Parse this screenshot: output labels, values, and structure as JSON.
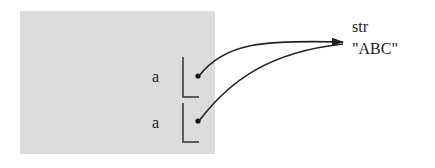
{
  "diagram": {
    "frame": {
      "color": "#dcdcdc"
    },
    "variables": [
      {
        "name": "a"
      },
      {
        "name": "a"
      }
    ],
    "object": {
      "type": "str",
      "value": "\"ABC\""
    },
    "colors": {
      "ink": "#222222"
    }
  }
}
